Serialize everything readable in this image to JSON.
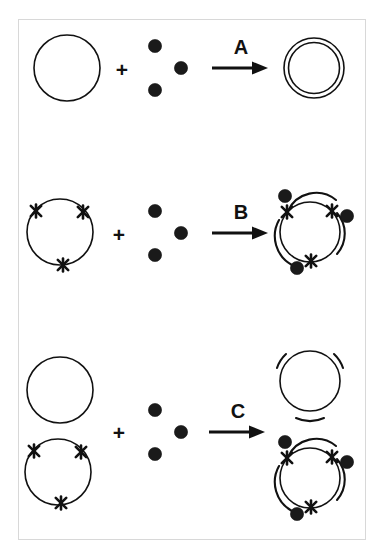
{
  "figure": {
    "background_color": "#ffffff",
    "frame_color": "#d8d8d8",
    "ink_color": "#111111",
    "particle_color": "#1a1a1a",
    "plus_symbol": "+",
    "rows": [
      {
        "id": "row-a",
        "label": "A",
        "reactants": [
          {
            "type": "plain-circle",
            "receptor_count": 0,
            "description": "plain empty circle"
          }
        ],
        "particles": {
          "count": 3,
          "arrangement": "triangle"
        },
        "products": [
          {
            "type": "double-ring-circle",
            "receptor_count": 0,
            "particle_count": 0,
            "description": "circle with complete concentric outer ring"
          }
        ]
      },
      {
        "id": "row-b",
        "label": "B",
        "reactants": [
          {
            "type": "receptor-circle",
            "receptor_count": 3,
            "description": "circle with three X receptor marks"
          }
        ],
        "particles": {
          "count": 3,
          "arrangement": "triangle"
        },
        "products": [
          {
            "type": "receptor-circle-with-bound-particles",
            "receptor_count": 3,
            "particle_count": 3,
            "arc_count": 3,
            "description": "circle with three X receptors, three partial outer arcs each ending in a bound particle"
          }
        ]
      },
      {
        "id": "row-c",
        "label": "C",
        "reactants": [
          {
            "type": "plain-circle",
            "receptor_count": 0,
            "description": "plain empty circle"
          },
          {
            "type": "receptor-circle",
            "receptor_count": 3,
            "description": "circle with three X receptor marks"
          }
        ],
        "particles": {
          "count": 3,
          "arrangement": "triangle"
        },
        "products": [
          {
            "type": "plain-circle-with-detached-arcs",
            "receptor_count": 0,
            "particle_count": 0,
            "arc_count": 3,
            "description": "plain circle with three short detached outer arc fragments"
          },
          {
            "type": "receptor-circle-with-bound-particles",
            "receptor_count": 3,
            "particle_count": 3,
            "arc_count": 3,
            "description": "circle with three X receptors, three partial outer arcs each ending in a bound particle"
          }
        ]
      }
    ],
    "legend_semantics": {
      "circle": "vesicle / membrane",
      "x-mark": "receptor",
      "filled-dot": "particle / ligand",
      "outer-ring": "coat layer"
    }
  }
}
